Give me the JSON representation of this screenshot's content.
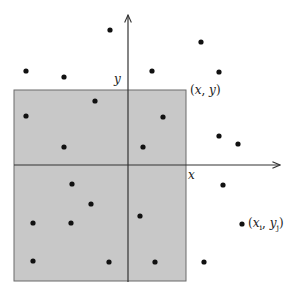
{
  "diagram": {
    "colors": {
      "region_fill": "#c8c8c8",
      "region_stroke": "#6b6b6b",
      "axis": "#333333",
      "dot": "#111111",
      "background": "#ffffff"
    },
    "region": {
      "x": 14,
      "y": 90,
      "width": 172,
      "height": 191
    },
    "axes": {
      "origin": [
        128,
        165
      ],
      "x_axis": {
        "from": [
          14,
          165
        ],
        "to": [
          280,
          165
        ],
        "label": "x"
      },
      "y_axis": {
        "from": [
          128,
          282
        ],
        "to": [
          128,
          15
        ],
        "label": "y"
      }
    },
    "labels": {
      "x_axis": "x",
      "y_axis": "y",
      "corner_point": "(x, y)",
      "sample_point": "(x_i, y_j)"
    },
    "points": [
      [
        110,
        30
      ],
      [
        201,
        42
      ],
      [
        26,
        71
      ],
      [
        64,
        77
      ],
      [
        152,
        71
      ],
      [
        219,
        72
      ],
      [
        95,
        101
      ],
      [
        26,
        116
      ],
      [
        163,
        117
      ],
      [
        64,
        147
      ],
      [
        143,
        147
      ],
      [
        219,
        136
      ],
      [
        238,
        144
      ],
      [
        72,
        184
      ],
      [
        223,
        185
      ],
      [
        91,
        204
      ],
      [
        33,
        223
      ],
      [
        71,
        223
      ],
      [
        140,
        216
      ],
      [
        242,
        224
      ],
      [
        33,
        261
      ],
      [
        109,
        262
      ],
      [
        155,
        262
      ],
      [
        204,
        262
      ]
    ]
  }
}
